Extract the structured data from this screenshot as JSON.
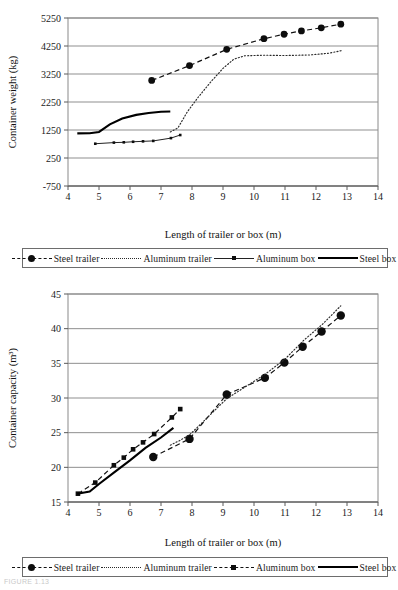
{
  "figure": {
    "caption_faint": "FIGURE 1.13"
  },
  "charts": [
    {
      "id": "weight",
      "ylabel": "Container weight (kg)",
      "xlabel": "Length of trailer or box (m)",
      "yticks": [
        -750,
        250,
        1250,
        2250,
        3250,
        4250,
        5250
      ],
      "xticks": [
        4,
        5,
        6,
        7,
        8,
        9,
        10,
        11,
        12,
        13,
        14
      ],
      "legend": [
        {
          "label": "Steel trailer",
          "style": "dashed",
          "marker": "circle"
        },
        {
          "label": "Aluminum trailer",
          "style": "dotted",
          "marker": "none"
        },
        {
          "label": "Aluminum box",
          "style": "solid-thin",
          "marker": "mini-square"
        },
        {
          "label": "Steel box",
          "style": "solid-thick",
          "marker": "none"
        }
      ]
    },
    {
      "id": "capacity",
      "ylabel": "Container capacity (m³)",
      "xlabel": "Length of trailer or box (m)",
      "yticks": [
        15,
        20,
        25,
        30,
        35,
        40,
        45
      ],
      "xticks": [
        4,
        5,
        6,
        7,
        8,
        9,
        10,
        11,
        12,
        13,
        14
      ],
      "legend": [
        {
          "label": "Steel trailer",
          "style": "dashed",
          "marker": "circle"
        },
        {
          "label": "Aluminum trailer",
          "style": "dotted",
          "marker": "none"
        },
        {
          "label": "Aluminum box",
          "style": "dashed",
          "marker": "square"
        },
        {
          "label": "Steel box",
          "style": "solid-thick",
          "marker": "none"
        }
      ]
    }
  ],
  "chart_data": [
    {
      "type": "line",
      "id": "container-weight",
      "title": "",
      "xlabel": "Length of trailer or box (m)",
      "ylabel": "Container weight (kg)",
      "xlim": [
        4,
        14
      ],
      "ylim": [
        -750,
        5250
      ],
      "yticks": [
        -750,
        250,
        1250,
        2250,
        3250,
        4250,
        5250
      ],
      "xticks": [
        4,
        5,
        6,
        7,
        8,
        9,
        10,
        11,
        12,
        13,
        14
      ],
      "grid": "horizontal",
      "legend_position": "below",
      "series": [
        {
          "name": "Steel trailer",
          "style": "dashed",
          "marker": "circle",
          "points": [
            [
              6.7,
              3020
            ],
            [
              7.92,
              3550
            ],
            [
              9.12,
              4130
            ],
            [
              10.32,
              4510
            ],
            [
              10.97,
              4670
            ],
            [
              11.53,
              4790
            ],
            [
              12.17,
              4900
            ],
            [
              12.8,
              5030
            ]
          ]
        },
        {
          "name": "Aluminum trailer",
          "style": "dotted",
          "marker": "none",
          "points": [
            [
              7.3,
              1180
            ],
            [
              7.55,
              1330
            ],
            [
              7.85,
              1900
            ],
            [
              8.2,
              2420
            ],
            [
              8.6,
              2960
            ],
            [
              9.0,
              3450
            ],
            [
              9.35,
              3780
            ],
            [
              9.7,
              3900
            ],
            [
              10.3,
              3920
            ],
            [
              11.0,
              3910
            ],
            [
              11.8,
              3930
            ],
            [
              12.4,
              3990
            ],
            [
              12.85,
              4090
            ]
          ]
        },
        {
          "name": "Aluminum box",
          "style": "solid-thin",
          "marker": "mini-square",
          "points": [
            [
              4.88,
              760
            ],
            [
              5.48,
              800
            ],
            [
              5.8,
              810
            ],
            [
              6.1,
              830
            ],
            [
              6.42,
              845
            ],
            [
              6.75,
              860
            ],
            [
              7.32,
              960
            ],
            [
              7.62,
              1070
            ]
          ]
        },
        {
          "name": "Steel box",
          "style": "solid-thick",
          "marker": "none",
          "points": [
            [
              4.3,
              1130
            ],
            [
              4.7,
              1135
            ],
            [
              5.0,
              1180
            ],
            [
              5.35,
              1450
            ],
            [
              5.75,
              1660
            ],
            [
              6.2,
              1790
            ],
            [
              6.6,
              1860
            ],
            [
              7.0,
              1900
            ],
            [
              7.3,
              1910
            ]
          ]
        }
      ]
    },
    {
      "type": "line",
      "id": "container-capacity",
      "title": "",
      "xlabel": "Length of trailer or box (m)",
      "ylabel": "Container capacity (m³)",
      "xlim": [
        4,
        14
      ],
      "ylim": [
        15,
        45
      ],
      "yticks": [
        15,
        20,
        25,
        30,
        35,
        40,
        45
      ],
      "xticks": [
        4,
        5,
        6,
        7,
        8,
        9,
        10,
        11,
        12,
        13,
        14
      ],
      "grid": "horizontal",
      "legend_position": "below",
      "series": [
        {
          "name": "Steel trailer",
          "style": "dashed",
          "marker": "circle",
          "points": [
            [
              6.75,
              21.5
            ],
            [
              7.92,
              24.1
            ],
            [
              9.12,
              30.5
            ],
            [
              10.35,
              32.9
            ],
            [
              10.98,
              35.1
            ],
            [
              11.57,
              37.4
            ],
            [
              12.18,
              39.6
            ],
            [
              12.8,
              41.9
            ]
          ]
        },
        {
          "name": "Aluminum trailer",
          "style": "dotted",
          "marker": "none",
          "points": [
            [
              7.3,
              23.2
            ],
            [
              7.62,
              23.9
            ],
            [
              7.95,
              24.8
            ],
            [
              9.12,
              29.9
            ],
            [
              10.35,
              33.4
            ],
            [
              11.0,
              35.6
            ],
            [
              11.6,
              38.3
            ],
            [
              12.2,
              40.6
            ],
            [
              12.8,
              43.3
            ]
          ]
        },
        {
          "name": "Aluminum box",
          "style": "dashed",
          "marker": "square",
          "points": [
            [
              4.32,
              16.2
            ],
            [
              4.88,
              17.8
            ],
            [
              5.48,
              20.3
            ],
            [
              5.8,
              21.4
            ],
            [
              6.1,
              22.6
            ],
            [
              6.42,
              23.6
            ],
            [
              6.78,
              24.8
            ],
            [
              7.35,
              27.2
            ],
            [
              7.62,
              28.4
            ]
          ]
        },
        {
          "name": "Steel box",
          "style": "solid-thick",
          "marker": "none",
          "points": [
            [
              4.3,
              16.2
            ],
            [
              4.7,
              16.5
            ],
            [
              5.0,
              17.6
            ],
            [
              5.5,
              19.3
            ],
            [
              6.0,
              21.0
            ],
            [
              6.5,
              22.8
            ],
            [
              7.0,
              24.3
            ],
            [
              7.4,
              25.7
            ]
          ]
        }
      ]
    }
  ]
}
